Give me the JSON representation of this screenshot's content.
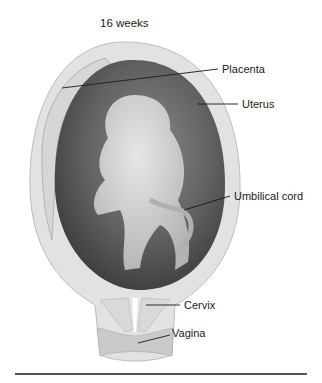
{
  "figure": {
    "title": "16 weeks",
    "labels": [
      {
        "id": "placenta",
        "text": "Placenta"
      },
      {
        "id": "uterus",
        "text": "Uterus"
      },
      {
        "id": "umbilical-cord",
        "text": "Umbilical cord"
      },
      {
        "id": "cervix",
        "text": "Cervix"
      },
      {
        "id": "vagina",
        "text": "Vagina"
      }
    ],
    "colors": {
      "uterine_wall": "#e3e3e3",
      "amniotic_cavity": "#5a5a5a",
      "fetus": "#cfcfcf",
      "leader_line": "#1a1a1a",
      "rule": "#555555"
    }
  }
}
